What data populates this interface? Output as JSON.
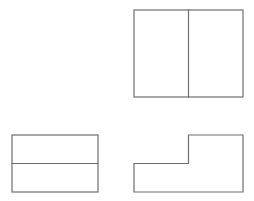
{
  "document": {
    "title": "Orthographic Projection — Three Views",
    "background_color": "#ffffff",
    "line_color": "#6e6e6e",
    "fill_color": "#ffffff",
    "line_width": 1.2,
    "canvas": {
      "width": 254,
      "height": 201
    }
  },
  "views": {
    "top_right": {
      "name": "Top View",
      "shape": "rectangle-with-vertical-divider",
      "outline": {
        "x": 134,
        "y": 10,
        "width": 109,
        "height": 87
      },
      "internal_lines": [
        {
          "name": "vertical-divider",
          "x1": 188.5,
          "y1": 10,
          "x2": 188.5,
          "y2": 97
        }
      ]
    },
    "bottom_left": {
      "name": "Side View",
      "shape": "rectangle-with-horizontal-divider",
      "outline": {
        "x": 12,
        "y": 135,
        "width": 86,
        "height": 57
      },
      "internal_lines": [
        {
          "name": "horizontal-divider",
          "x1": 12,
          "y1": 163.5,
          "x2": 98,
          "y2": 163.5
        }
      ]
    },
    "bottom_right": {
      "name": "Front View",
      "shape": "l-shaped-step-profile",
      "points": "134,163.5 188.5,163.5 188.5,135 243,135 243,192 134,192",
      "bounds": {
        "x": 134,
        "y": 135,
        "width": 109,
        "height": 57
      },
      "step": {
        "x": 188.5,
        "y": 163.5
      }
    }
  }
}
